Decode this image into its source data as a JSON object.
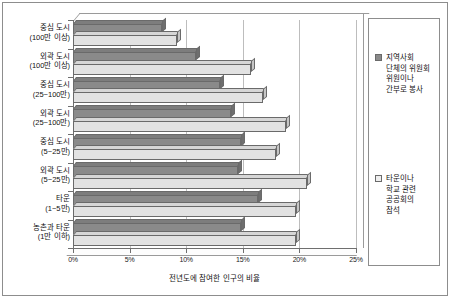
{
  "chart_data": {
    "type": "bar",
    "orientation": "horizontal",
    "title": "",
    "xlabel": "전년도에 참여한 인구의 비율",
    "ylabel": "",
    "xlim": [
      0,
      25
    ],
    "xticks": [
      "0%",
      "5%",
      "10%",
      "15%",
      "20%",
      "25%"
    ],
    "xtick_values": [
      0,
      5,
      10,
      15,
      20,
      25
    ],
    "grid": true,
    "legend_position": "right",
    "categories": [
      "중심 도시\n(100만 이상)",
      "외곽 도시\n(100만 이상)",
      "중심 도시\n(25~100만)",
      "외곽 도시\n(25~100만)",
      "중심 도시\n(5~25만)",
      "외곽 도시\n(5~25만)",
      "타운\n(1~5만)",
      "농촌과 타운\n(1만 이하)"
    ],
    "series": [
      {
        "name": "지역사회 단체의 위원회 위원이나 간부로 봉사",
        "color": "#8a8a8a",
        "values": [
          7.9,
          10.9,
          13.0,
          14.0,
          14.8,
          14.6,
          16.3,
          14.8
        ]
      },
      {
        "name": "타운이나 학교 관련 공공회의 참석",
        "color": "#e2e2e2",
        "values": [
          9.2,
          15.7,
          16.8,
          18.8,
          17.9,
          20.7,
          19.7,
          19.7
        ]
      }
    ]
  },
  "axis": {
    "x_title": "전년도에 참여한 인구의 비율",
    "ticks": [
      {
        "label": "0%",
        "value": 0
      },
      {
        "label": "5%",
        "value": 5
      },
      {
        "label": "10%",
        "value": 10
      },
      {
        "label": "15%",
        "value": 15
      },
      {
        "label": "20%",
        "value": 20
      },
      {
        "label": "25%",
        "value": 25
      }
    ]
  },
  "categories": [
    {
      "line1": "중심 도시",
      "line2": "(100만 이상)"
    },
    {
      "line1": "외곽 도시",
      "line2": "(100만 이상)"
    },
    {
      "line1": "중심 도시",
      "line2": "(25~100만)"
    },
    {
      "line1": "외곽 도시",
      "line2": "(25~100만)"
    },
    {
      "line1": "중심 도시",
      "line2": "(5~25만)"
    },
    {
      "line1": "외곽 도시",
      "line2": "(5~25만)"
    },
    {
      "line1": "타운",
      "line2": "(1~5만)"
    },
    {
      "line1": "농촌과 타운",
      "line2": "(1만 이하)"
    }
  ],
  "legend": {
    "entries": [
      {
        "swatch": "dark",
        "lines": [
          "지역사회",
          "단체의 위원회",
          "위원이나",
          "간부로 봉사"
        ]
      },
      {
        "swatch": "light",
        "lines": [
          "타운이나",
          "학교 관련",
          "공공회의",
          "참석"
        ]
      }
    ]
  },
  "colors": {
    "series_dark": "#8a8a8a",
    "series_light": "#e2e2e2",
    "grid": "#bdbdbd",
    "axis": "#6f6f6f",
    "frame": "#8d8d8d",
    "background": "#ffffff"
  }
}
